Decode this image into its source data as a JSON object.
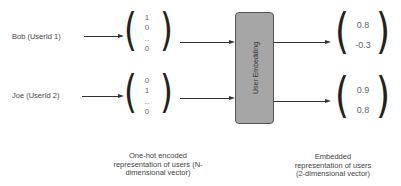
{
  "inputs": [
    {
      "label": "Bob (UserId 1)",
      "one_hot": [
        "1",
        "0",
        "..",
        "0"
      ],
      "embedding": [
        "0.8",
        "-0.3"
      ]
    },
    {
      "label": "Joe (UserId 2)",
      "one_hot": [
        "0",
        "1",
        "..",
        "0"
      ],
      "embedding": [
        "0.9",
        "0.8"
      ]
    }
  ],
  "embedding_layer": {
    "label": "User Embedding",
    "fill": "#a6a6a6"
  },
  "captions": {
    "one_hot": [
      "One-hot encoded",
      "representation of users (N-",
      "dimensional vector)"
    ],
    "embedded": [
      "Embedded",
      "representation of users",
      "(2-dimensional vector)"
    ]
  }
}
